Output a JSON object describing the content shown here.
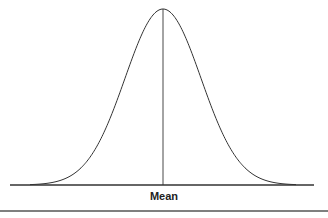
{
  "figure": {
    "type": "normal-distribution-curve",
    "center_label": "Mean",
    "line_color": "#333333",
    "background": "#ffffff"
  },
  "curve": {
    "mean_x": 163,
    "peak_y": 9,
    "baseline_y": 185,
    "sigma_px": 38,
    "baseline_start_x": 10,
    "baseline_end_x": 314
  }
}
